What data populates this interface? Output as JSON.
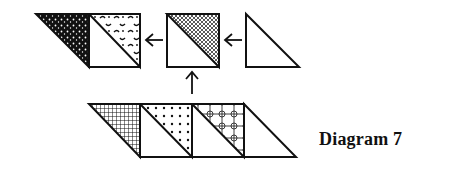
{
  "caption": "Diagram 7",
  "colors": {
    "ink": "#111111",
    "paper": "#ffffff"
  },
  "top_row": {
    "pieces": [
      {
        "shape": "triangle",
        "fabric": "dark-speckled"
      },
      {
        "shape": "half-square",
        "fabric": "swirl-print"
      },
      {
        "shape": "half-square",
        "fabric": "crosshatch"
      },
      {
        "shape": "triangle",
        "fabric": "plain"
      }
    ],
    "arrows": [
      "left",
      "left"
    ]
  },
  "vertical_arrow": "up",
  "bottom_row": {
    "pieces": [
      {
        "shape": "triangle",
        "fabric": "grid-check"
      },
      {
        "shape": "half-square",
        "fabric": "polka-dot"
      },
      {
        "shape": "half-square",
        "fabric": "floral-lattice"
      },
      {
        "shape": "triangle",
        "fabric": "plain"
      }
    ]
  }
}
